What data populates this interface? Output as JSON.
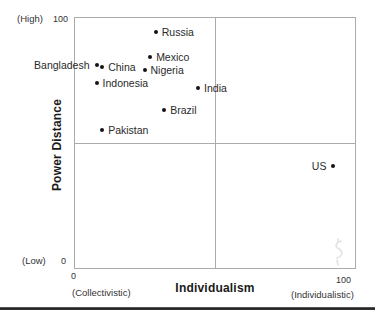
{
  "chart_data": {
    "type": "scatter",
    "title": "",
    "xlabel": "Individualism",
    "xlabel_sub_left": "(Collectivistic)",
    "xlabel_sub_right": "(Individualistic)",
    "ylabel": "Power Distance",
    "ylabel_high": "(High)",
    "ylabel_low": "(Low)",
    "x_ticks": {
      "min": "0",
      "max": "100"
    },
    "y_ticks": {
      "min": "0",
      "max": "100"
    },
    "xlim": [
      0,
      100
    ],
    "ylim": [
      0,
      100
    ],
    "grid": "quadrant-dividers",
    "legend": "none",
    "quadrant_lines": {
      "x": 50,
      "y": 50
    },
    "points": [
      {
        "label": "Russia",
        "x": 29,
        "y": 94,
        "label_side": "right"
      },
      {
        "label": "Mexico",
        "x": 27,
        "y": 84,
        "label_side": "right"
      },
      {
        "label": "Bangladesh",
        "x": 8,
        "y": 81,
        "label_side": "left"
      },
      {
        "label": "China",
        "x": 10,
        "y": 80,
        "label_side": "right"
      },
      {
        "label": "Nigeria",
        "x": 25,
        "y": 79,
        "label_side": "right"
      },
      {
        "label": "Indonesia",
        "x": 8,
        "y": 74,
        "label_side": "right"
      },
      {
        "label": "India",
        "x": 44,
        "y": 72,
        "label_side": "right"
      },
      {
        "label": "Brazil",
        "x": 32,
        "y": 63,
        "label_side": "right"
      },
      {
        "label": "Pakistan",
        "x": 10,
        "y": 55,
        "label_side": "right"
      },
      {
        "label": "US",
        "x": 92,
        "y": 41,
        "label_side": "left"
      }
    ]
  },
  "colors": {
    "dot": "#151515",
    "plot_border": "#ababab",
    "label_text": "#2a2a2a",
    "axis_title": "#1a1a1a",
    "bottom_rule": "#1f1f1f",
    "watermark_artifact": "#dcdcdc"
  }
}
